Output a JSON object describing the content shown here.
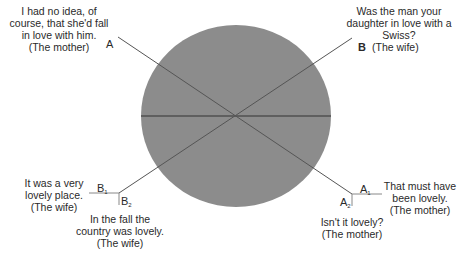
{
  "diagram": {
    "circle": {
      "cx": 236,
      "cy": 116,
      "rx": 95,
      "ry": 91,
      "fill": "#8c8c8c"
    },
    "lines_color": "#444444",
    "outer_line_color": "#999999"
  },
  "quotes": {
    "top_left": {
      "lines": [
        "I had no idea, of",
        "course, that she'd fall",
        "in love with him.",
        "(The mother)"
      ]
    },
    "top_right": {
      "lines": [
        "Was the man your",
        "daughter in love with a",
        "Swiss?",
        "(The wife)"
      ]
    },
    "bottom_left_b1": {
      "lines": [
        "It was a very",
        "lovely place.",
        "(The wife)"
      ]
    },
    "bottom_left_b2": {
      "lines": [
        "In the fall the",
        "country was lovely.",
        "(The wife)"
      ]
    },
    "bottom_right_a1": {
      "lines": [
        "That must have",
        "been lovely.",
        "(The mother)"
      ]
    },
    "bottom_right_a2": {
      "lines": [
        "Isn't it lovely?",
        "(The mother)"
      ]
    }
  },
  "markers": {
    "a": "A",
    "b": "B",
    "a1_base": "A",
    "a1_sub": "1",
    "a2_base": "A",
    "a2_sub": "2",
    "b1_base": "B",
    "b1_sub": "1",
    "b2_base": "B",
    "b2_sub": "2"
  }
}
